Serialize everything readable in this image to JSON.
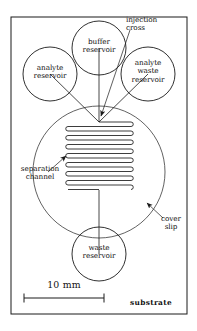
{
  "figure": {
    "substrate_frame": {
      "x": 11,
      "y": 17,
      "width": 176,
      "height": 297
    },
    "colors": {
      "line": "#1a1a1a",
      "background": "#ffffff",
      "text": "#121212"
    },
    "cover_slip_circle": {
      "cx": 99,
      "cy": 172,
      "r": 66
    },
    "reservoirs": [
      {
        "name": "analyte-reservoir",
        "cx": 50,
        "cy": 74,
        "r": 27,
        "label": "analyte\nreservoir"
      },
      {
        "name": "buffer-reservoir",
        "cx": 99,
        "cy": 48,
        "r": 27,
        "label": "buffer\nreservoir"
      },
      {
        "name": "analyte-waste-reservoir",
        "cx": 148,
        "cy": 74,
        "r": 27,
        "label": "analyte\nwaste\nreservoir"
      },
      {
        "name": "waste-reservoir",
        "cx": 99,
        "cy": 254,
        "r": 27,
        "label": "waste\nreservoir"
      }
    ],
    "injection_cross": {
      "x": 99,
      "y": 118
    },
    "serpentine": {
      "left": 68,
      "right": 131,
      "top": 122,
      "bottom": 190,
      "runs": 15,
      "label": "separation channel"
    },
    "scale_bar": {
      "x1": 24,
      "x2": 104,
      "y": 298,
      "label": "10 mm"
    }
  },
  "labels": {
    "analyte_reservoir": "analyte\nreservoir",
    "buffer_reservoir": "buffer\nreservoir",
    "analyte_waste_reservoir": "analyte\nwaste\nreservoir",
    "waste_reservoir": "waste\nreservoir",
    "injection_cross": "injection\ncross",
    "separation_channel": "separation\nchannel",
    "cover_slip": "cover\nslip",
    "substrate": "substrate",
    "scale": "10 mm"
  }
}
